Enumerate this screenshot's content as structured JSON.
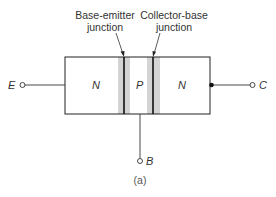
{
  "labels": {
    "base_emitter_line1": "Base-emitter",
    "base_emitter_line2": "junction",
    "collector_base_line1": "Collector-base",
    "collector_base_line2": "junction",
    "region_emitter": "N",
    "region_base": "P",
    "region_collector": "N",
    "terminal_emitter": "E",
    "terminal_collector": "C",
    "terminal_base": "B",
    "caption": "(a)"
  },
  "colors": {
    "line": "#222222",
    "depletion": "#d4d4d4",
    "text": "#333333"
  }
}
